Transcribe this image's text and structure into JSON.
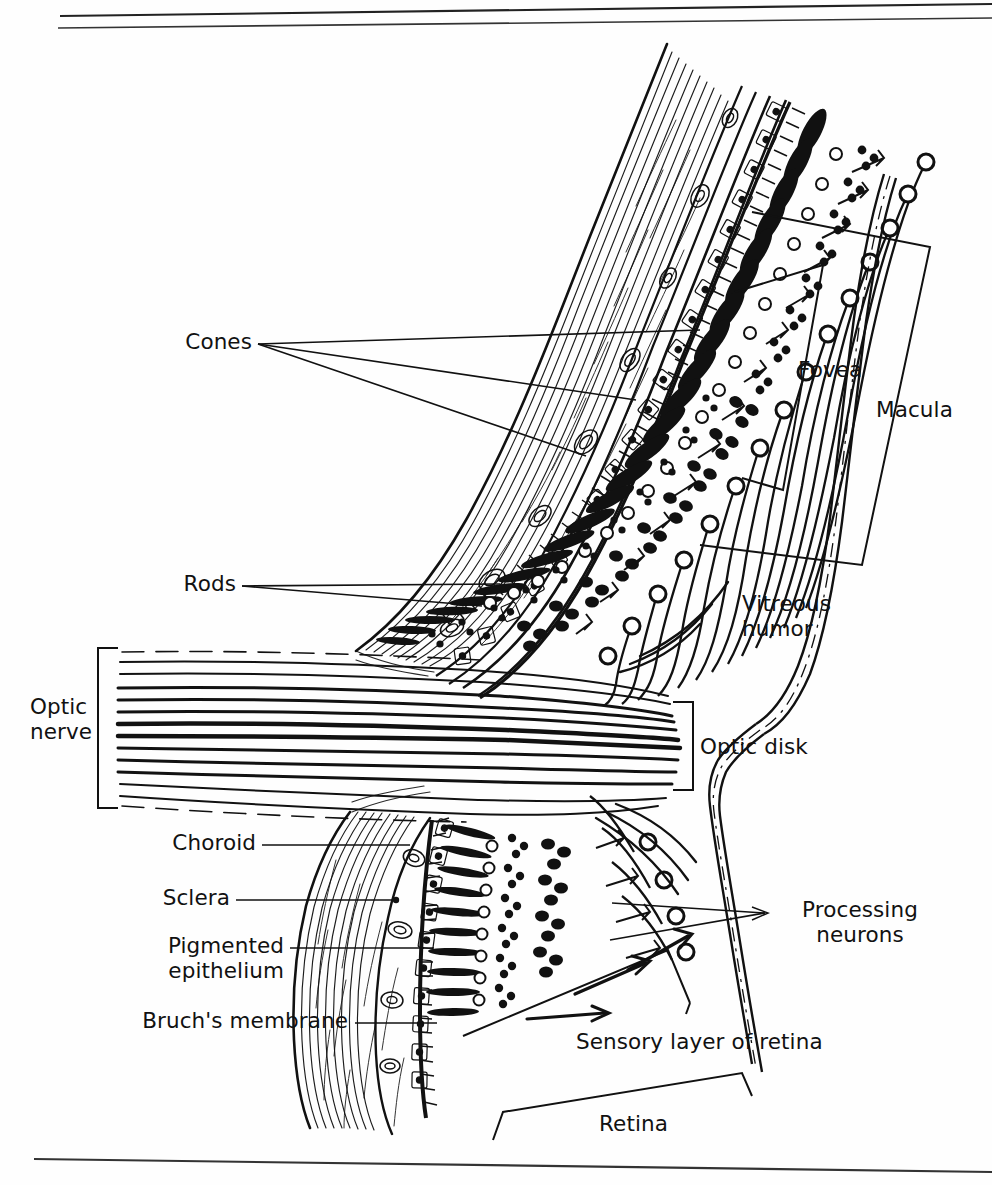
{
  "page": {
    "type": "anatomical-illustration",
    "style": "black-and-white line drawing",
    "background_color": "#ffffff",
    "ink_color": "#111111"
  },
  "rules": {
    "top_rule_1": "horizontal rule",
    "top_rule_2": "horizontal rule",
    "bottom_rule": "horizontal rule"
  },
  "labels": {
    "cones": "Cones",
    "rods": "Rods",
    "optic_nerve": "Optic\nnerve",
    "choroid": "Choroid",
    "sclera": "Sclera",
    "pigmented_epithelium": "Pigmented\nepithelium",
    "bruchs_membrane": "Bruch's membrane",
    "fovea": "Fovea",
    "macula": "Macula",
    "vitreous_humor": "Vitreous\nhumor",
    "optic_disk": "Optic disk",
    "processing_neurons": "Processing\nneurons",
    "sensory_layer": "Sensory layer of retina",
    "retina": "Retina"
  },
  "annotations": {
    "light_direction_arrows": 3,
    "cones_leader_lines": 3,
    "rods_leader_lines": 2,
    "processing_neurons_leader_lines": 2,
    "brackets": [
      "optic-nerve-bracket",
      "fovea-bracket",
      "macula-bracket",
      "optic-disk-bracket",
      "sensory-layer-bracket",
      "retina-bracket"
    ]
  },
  "structures": {
    "sclera": "outer fibrous coat drawn as dense wavy striations",
    "choroid": "vascular layer with oval vessel cross-sections",
    "pigmented_epithelium": "single row of boxed cells with dark nuclei",
    "bruchs_membrane": "thin dark line beneath pigmented epithelium",
    "brush_border": "fine comb-like hatching of photoreceptor outer segments",
    "photoreceptors": "elongated solid black rod and cone cell bodies",
    "bipolar_cells": "clusters of small dark dots",
    "ganglion_cells": "open ring cell bodies with axons",
    "nerve_fiber_layer": "long curving axon bundles converging to optic nerve",
    "optic_nerve": "horizontal bundle of nerve fibres exiting left"
  }
}
